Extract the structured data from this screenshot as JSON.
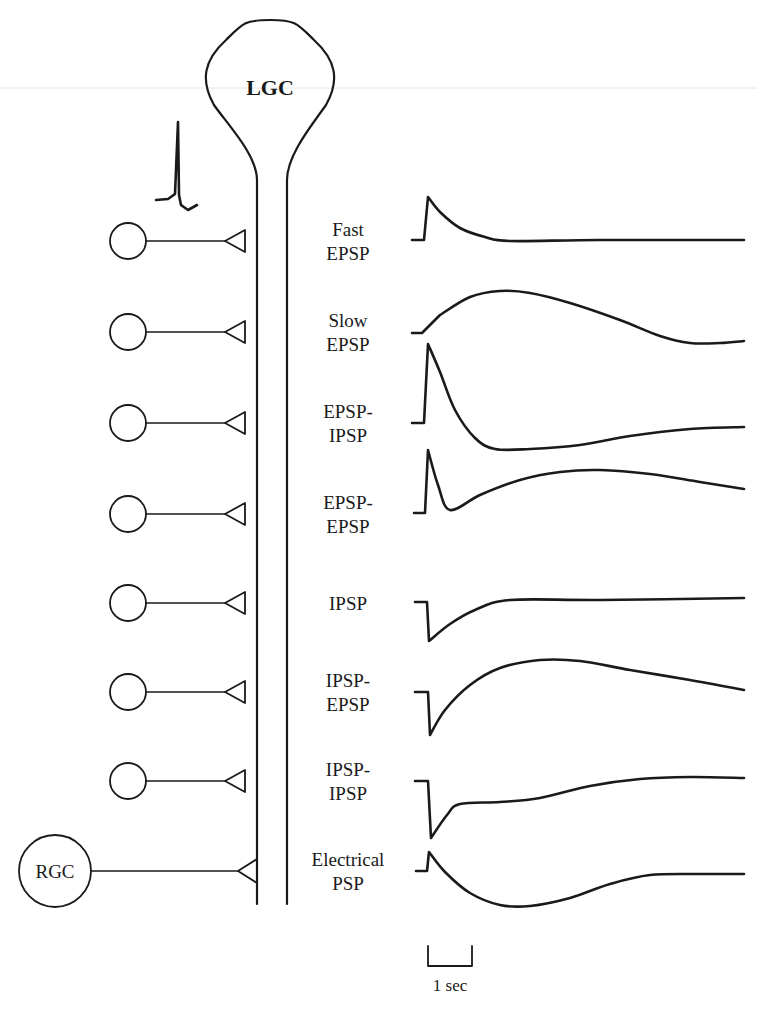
{
  "figure": {
    "background": "#ffffff",
    "ink": "#1a1a1a",
    "width": 757,
    "height": 1010
  },
  "lgc": {
    "label": "LGC",
    "soma": {
      "left": 208,
      "right": 332,
      "top": 20,
      "neck_y": 180
    },
    "stalk": {
      "left_x": 257,
      "right_x": 287,
      "bottom_y": 904
    },
    "label_pos": [
      270,
      95
    ]
  },
  "spike_icon": {
    "name": "action-potential-spike",
    "points": [
      [
        156,
        200
      ],
      [
        168,
        199
      ],
      [
        175,
        194
      ],
      [
        178,
        122
      ],
      [
        179,
        195
      ],
      [
        181,
        205
      ],
      [
        188,
        210
      ],
      [
        197,
        205
      ]
    ]
  },
  "faint_rule_y": 88,
  "inputs": [
    {
      "id": "fast-epsp",
      "label_lines": [
        "Fast",
        "EPSP"
      ],
      "y": 241,
      "presynaptic": "small"
    },
    {
      "id": "slow-epsp",
      "label_lines": [
        "Slow",
        "EPSP"
      ],
      "y": 332,
      "presynaptic": "small"
    },
    {
      "id": "epsp-ipsp",
      "label_lines": [
        "EPSP-",
        "IPSP"
      ],
      "y": 423,
      "presynaptic": "small"
    },
    {
      "id": "epsp-epsp",
      "label_lines": [
        "EPSP-",
        "EPSP"
      ],
      "y": 514,
      "presynaptic": "small"
    },
    {
      "id": "ipsp",
      "label_lines": [
        "IPSP"
      ],
      "y": 603,
      "presynaptic": "small"
    },
    {
      "id": "ipsp-epsp",
      "label_lines": [
        "IPSP-",
        "EPSP"
      ],
      "y": 692,
      "presynaptic": "small"
    },
    {
      "id": "ipsp-ipsp",
      "label_lines": [
        "IPSP-",
        "IPSP"
      ],
      "y": 781,
      "presynaptic": "small"
    },
    {
      "id": "electrical-psp",
      "label_lines": [
        "Electrical",
        "PSP"
      ],
      "y": 871,
      "presynaptic": "rgc",
      "presynaptic_label": "RGC"
    }
  ],
  "presynaptic_geometry": {
    "small": {
      "cx": 128,
      "r": 18,
      "axon_end": 225,
      "terminal_tip": 225,
      "terminal_base": 245,
      "terminal_half": 11
    },
    "rgc": {
      "cx": 55,
      "r": 36,
      "axon_end": 238,
      "terminal_tip": 238,
      "terminal_base": 257,
      "terminal_half": 12
    }
  },
  "label_center_x": 348,
  "chart_data": {
    "type": "line",
    "xlabel": "time",
    "ylabel": "membrane potential (schematic)",
    "scale_bar": {
      "label": "1 sec",
      "x1": 428,
      "x2": 472,
      "y_top": 946,
      "y_bottom": 966
    },
    "series": [
      {
        "name": "Fast EPSP",
        "points": [
          [
            412,
            240
          ],
          [
            424,
            240
          ],
          [
            428,
            197
          ],
          [
            440,
            212
          ],
          [
            460,
            228
          ],
          [
            485,
            237
          ],
          [
            510,
            241
          ],
          [
            600,
            240
          ],
          [
            744,
            240
          ]
        ]
      },
      {
        "name": "Slow EPSP",
        "points": [
          [
            412,
            333
          ],
          [
            422,
            333
          ],
          [
            440,
            315
          ],
          [
            470,
            297
          ],
          [
            500,
            291
          ],
          [
            530,
            293
          ],
          [
            570,
            303
          ],
          [
            620,
            320
          ],
          [
            660,
            336
          ],
          [
            690,
            343
          ],
          [
            720,
            343
          ],
          [
            744,
            341
          ]
        ]
      },
      {
        "name": "EPSP-IPSP",
        "points": [
          [
            412,
            423
          ],
          [
            424,
            423
          ],
          [
            428,
            344
          ],
          [
            440,
            372
          ],
          [
            455,
            410
          ],
          [
            475,
            438
          ],
          [
            495,
            449
          ],
          [
            530,
            449
          ],
          [
            580,
            445
          ],
          [
            630,
            436
          ],
          [
            690,
            429
          ],
          [
            744,
            427
          ]
        ]
      },
      {
        "name": "EPSP-EPSP",
        "points": [
          [
            414,
            513
          ],
          [
            425,
            513
          ],
          [
            428,
            450
          ],
          [
            438,
            485
          ],
          [
            450,
            510
          ],
          [
            480,
            495
          ],
          [
            520,
            480
          ],
          [
            560,
            472
          ],
          [
            600,
            470
          ],
          [
            650,
            474
          ],
          [
            700,
            482
          ],
          [
            744,
            489
          ]
        ]
      },
      {
        "name": "IPSP",
        "points": [
          [
            415,
            602
          ],
          [
            427,
            602
          ],
          [
            429,
            641
          ],
          [
            450,
            624
          ],
          [
            475,
            610
          ],
          [
            510,
            600
          ],
          [
            600,
            600
          ],
          [
            744,
            598
          ]
        ]
      },
      {
        "name": "IPSP-EPSP",
        "points": [
          [
            415,
            692
          ],
          [
            428,
            692
          ],
          [
            430,
            735
          ],
          [
            445,
            710
          ],
          [
            470,
            685
          ],
          [
            500,
            668
          ],
          [
            540,
            660
          ],
          [
            580,
            661
          ],
          [
            630,
            670
          ],
          [
            690,
            680
          ],
          [
            744,
            690
          ]
        ]
      },
      {
        "name": "IPSP-IPSP",
        "points": [
          [
            415,
            781
          ],
          [
            428,
            781
          ],
          [
            431,
            838
          ],
          [
            447,
            815
          ],
          [
            460,
            804
          ],
          [
            500,
            802
          ],
          [
            540,
            798
          ],
          [
            590,
            786
          ],
          [
            640,
            779
          ],
          [
            690,
            777
          ],
          [
            744,
            778
          ]
        ]
      },
      {
        "name": "Electrical PSP",
        "points": [
          [
            416,
            871
          ],
          [
            427,
            871
          ],
          [
            429,
            852
          ],
          [
            445,
            872
          ],
          [
            470,
            893
          ],
          [
            500,
            905
          ],
          [
            530,
            906
          ],
          [
            570,
            898
          ],
          [
            610,
            884
          ],
          [
            650,
            875
          ],
          [
            700,
            874
          ],
          [
            744,
            874
          ]
        ]
      }
    ]
  }
}
